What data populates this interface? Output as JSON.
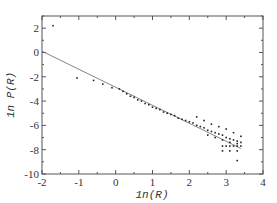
{
  "chart_data": {
    "type": "scatter",
    "title": "",
    "xlabel": "1n(R)",
    "ylabel": "1n P(R)",
    "xlim": [
      -2,
      4
    ],
    "ylim": [
      -10,
      3
    ],
    "xticks": [
      -2,
      -1,
      0,
      1,
      2,
      3,
      4
    ],
    "yticks": [
      -10,
      -8,
      -6,
      -4,
      -2,
      0,
      2
    ],
    "grid": false,
    "legend": null,
    "fit_line": {
      "x": [
        -2,
        3.4
      ],
      "y": [
        0.1,
        -7.9
      ]
    },
    "series": [
      {
        "name": "data",
        "x": [
          -1.7,
          -1.05,
          -0.6,
          -0.35,
          -0.1,
          0.1,
          0.2,
          0.3,
          0.4,
          0.5,
          0.6,
          0.7,
          0.8,
          0.9,
          1.0,
          1.1,
          1.2,
          1.3,
          1.4,
          1.5,
          1.6,
          1.7,
          1.8,
          1.9,
          2.0,
          2.1,
          2.2,
          2.3,
          2.4,
          2.5,
          2.6,
          2.7,
          2.8,
          2.9,
          3.0,
          3.1,
          3.2,
          3.3,
          3.4,
          2.2,
          2.4,
          2.6,
          2.8,
          3.0,
          3.2,
          3.4,
          2.5,
          2.7,
          2.9,
          3.1,
          3.3,
          2.9,
          3.0,
          3.1,
          3.2,
          3.3,
          3.4,
          2.9,
          3.1,
          3.3,
          3.3
        ],
        "y": [
          2.2,
          -2.1,
          -2.3,
          -2.6,
          -2.9,
          -3.0,
          -3.2,
          -3.4,
          -3.6,
          -3.7,
          -3.9,
          -4.0,
          -4.2,
          -4.3,
          -4.5,
          -4.6,
          -4.7,
          -4.9,
          -5.0,
          -5.1,
          -5.2,
          -5.4,
          -5.5,
          -5.6,
          -5.7,
          -5.8,
          -6.0,
          -6.1,
          -6.2,
          -6.4,
          -6.5,
          -6.6,
          -6.7,
          -6.8,
          -7.0,
          -7.1,
          -7.2,
          -7.3,
          -7.4,
          -5.3,
          -5.6,
          -5.9,
          -6.1,
          -6.3,
          -6.6,
          -6.9,
          -6.8,
          -7.0,
          -7.2,
          -7.4,
          -7.5,
          -7.7,
          -7.7,
          -7.7,
          -7.7,
          -7.7,
          -7.7,
          -8.1,
          -8.1,
          -8.1,
          -8.9
        ]
      }
    ]
  }
}
